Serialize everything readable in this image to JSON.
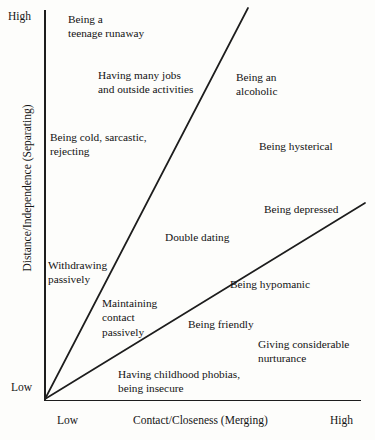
{
  "figure": {
    "type": "conceptual-quadrant-diagram",
    "background_color": "#fdfdfb",
    "ink_color": "#1d1d1d"
  },
  "axes": {
    "y": {
      "title": "Distance/Independence (Separating)",
      "high_label": "High",
      "low_label": "Low"
    },
    "x": {
      "title": "Contact/Closeness (Merging)",
      "low_label": "Low",
      "high_label": "High"
    }
  },
  "divider_lines": [
    {
      "name": "steep-divider",
      "x1": 45,
      "y1": 399,
      "x2": 248,
      "y2": 8
    },
    {
      "name": "shallow-divider",
      "x1": 45,
      "y1": 399,
      "x2": 365,
      "y2": 203
    }
  ],
  "chart_data": {
    "type": "scatter",
    "title": "",
    "xlabel": "Contact/Closeness (Merging)",
    "ylabel": "Distance/Independence (Separating)",
    "xlim": [
      "Low",
      "High"
    ],
    "ylim": [
      "Low",
      "High"
    ],
    "grid": false,
    "legend": "none",
    "annotations": [
      "Being a teenage runaway",
      "Having many jobs and outside activities",
      "Being an alcoholic",
      "Being cold, sarcastic, rejecting",
      "Being hysterical",
      "Being depressed",
      "Withdrawing passively",
      "Double dating",
      "Maintaining contact passively",
      "Being hypomanic",
      "Being friendly",
      "Giving considerable nurturance",
      "Having childhood phobias, being insecure"
    ]
  },
  "labels": [
    {
      "name": "label-teenage-runaway",
      "text": "Being a\nteenage runaway",
      "x": 68,
      "y": 12
    },
    {
      "name": "label-many-jobs",
      "text": "Having many jobs\nand outside activities",
      "x": 98,
      "y": 68
    },
    {
      "name": "label-alcoholic",
      "text": "Being an\nalcoholic",
      "x": 236,
      "y": 70
    },
    {
      "name": "label-cold-sarcastic",
      "text": "Being cold, sarcastic,\nrejecting",
      "x": 50,
      "y": 130
    },
    {
      "name": "label-hysterical",
      "text": "Being hysterical",
      "x": 259,
      "y": 139
    },
    {
      "name": "label-depressed",
      "text": "Being depressed",
      "x": 264,
      "y": 202
    },
    {
      "name": "label-withdrawing",
      "text": "Withdrawing\npassively",
      "x": 48,
      "y": 258
    },
    {
      "name": "label-double-dating",
      "text": "Double dating",
      "x": 165,
      "y": 230
    },
    {
      "name": "label-maintaining-contact",
      "text": "Maintaining\ncontact\npassively",
      "x": 102,
      "y": 296
    },
    {
      "name": "label-hypomanic",
      "text": "Being hypomanic",
      "x": 230,
      "y": 277
    },
    {
      "name": "label-friendly",
      "text": "Being friendly",
      "x": 188,
      "y": 317
    },
    {
      "name": "label-nurturance",
      "text": "Giving considerable\nnurturance",
      "x": 258,
      "y": 337
    },
    {
      "name": "label-childhood-phobias",
      "text": "Having childhood phobias,\nbeing insecure",
      "x": 118,
      "y": 367
    }
  ]
}
